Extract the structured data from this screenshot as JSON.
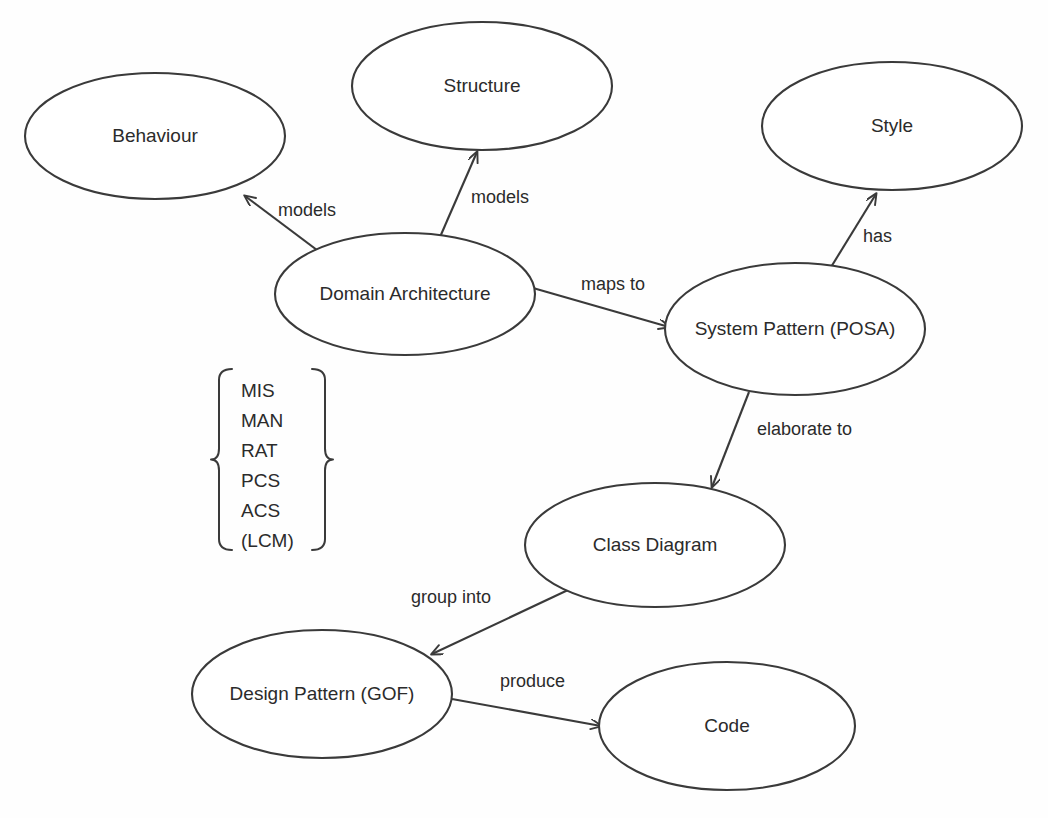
{
  "canvas": {
    "width": 1048,
    "height": 818,
    "background_color": "#fefefe",
    "stroke_color": "#3a3a3a",
    "text_color": "#2b2b2b"
  },
  "diagram": {
    "type": "concept-map",
    "nodes": [
      {
        "id": "behaviour",
        "label": "Behaviour",
        "cx": 155,
        "cy": 136,
        "rx": 130,
        "ry": 63
      },
      {
        "id": "structure",
        "label": "Structure",
        "cx": 482,
        "cy": 86,
        "rx": 130,
        "ry": 64
      },
      {
        "id": "style",
        "label": "Style",
        "cx": 892,
        "cy": 126,
        "rx": 130,
        "ry": 64
      },
      {
        "id": "domain-architecture",
        "label": "Domain Architecture",
        "cx": 405,
        "cy": 294,
        "rx": 130,
        "ry": 61
      },
      {
        "id": "system-pattern",
        "label": "System Pattern (POSA)",
        "cx": 795,
        "cy": 329,
        "rx": 130,
        "ry": 66
      },
      {
        "id": "class-diagram",
        "label": "Class Diagram",
        "cx": 655,
        "cy": 545,
        "rx": 130,
        "ry": 62
      },
      {
        "id": "design-pattern",
        "label": "Design Pattern (GOF)",
        "cx": 322,
        "cy": 694,
        "rx": 130,
        "ry": 64
      },
      {
        "id": "code",
        "label": "Code",
        "cx": 727,
        "cy": 726,
        "rx": 128,
        "ry": 64
      }
    ],
    "edges": [
      {
        "id": "da-models-behaviour",
        "label": "models",
        "from": "domain-architecture",
        "to": "behaviour",
        "x1": 325,
        "y1": 256,
        "x2": 245,
        "y2": 196,
        "label_x": 278,
        "label_y": 211
      },
      {
        "id": "da-models-structure",
        "label": "models",
        "from": "domain-architecture",
        "to": "structure",
        "x1": 440,
        "y1": 237,
        "x2": 477,
        "y2": 152,
        "label_x": 471,
        "label_y": 198
      },
      {
        "id": "da-mapsto-sp",
        "label": "maps to",
        "from": "domain-architecture",
        "to": "system-pattern",
        "x1": 533,
        "y1": 288,
        "x2": 669,
        "y2": 327,
        "label_x": 581,
        "label_y": 285
      },
      {
        "id": "sp-has-style",
        "label": "has",
        "from": "system-pattern",
        "to": "style",
        "x1": 828,
        "y1": 272,
        "x2": 876,
        "y2": 194,
        "label_x": 863,
        "label_y": 237
      },
      {
        "id": "sp-elaborateto-cd",
        "label": "elaborate to",
        "from": "system-pattern",
        "to": "class-diagram",
        "x1": 749,
        "y1": 392,
        "x2": 712,
        "y2": 487,
        "label_x": 757,
        "label_y": 430
      },
      {
        "id": "cd-groupinto-dp",
        "label": "group into",
        "from": "class-diagram",
        "to": "design-pattern",
        "x1": 568,
        "y1": 590,
        "x2": 432,
        "y2": 654,
        "label_x": 411,
        "label_y": 598
      },
      {
        "id": "dp-produce-code",
        "label": "produce",
        "from": "design-pattern",
        "to": "code",
        "x1": 452,
        "y1": 699,
        "x2": 601,
        "y2": 726,
        "label_x": 500,
        "label_y": 682
      }
    ],
    "bracket_group": {
      "id": "domain-architecture-kinds",
      "items": [
        "MIS",
        "MAN",
        "RAT",
        "PCS",
        "ACS",
        "(LCM)"
      ],
      "left_bracket_x": 219,
      "right_bracket_x": 325,
      "top_y": 369,
      "bottom_y": 550,
      "text_x": 241,
      "first_item_y": 392,
      "item_spacing": 30
    }
  }
}
